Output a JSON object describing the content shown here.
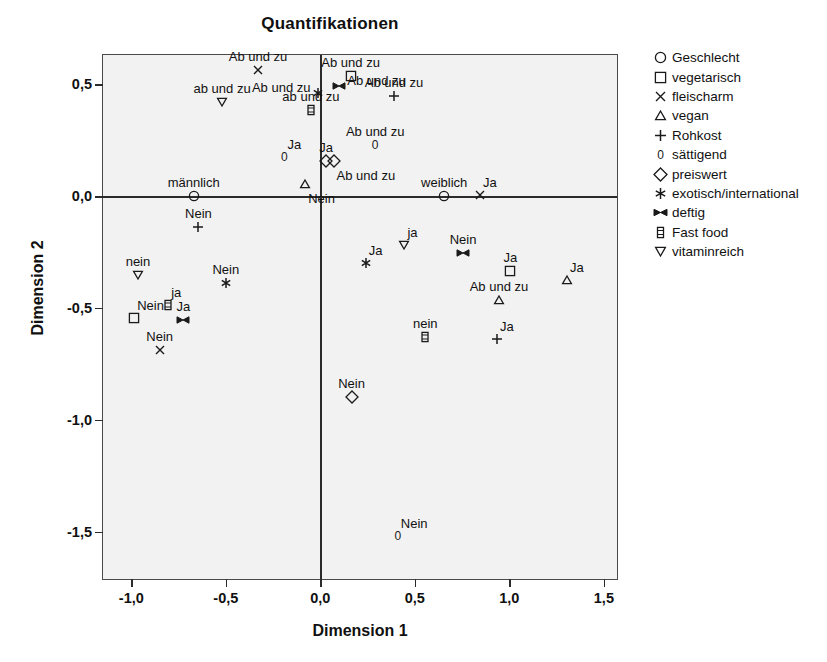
{
  "chart_data": {
    "type": "scatter",
    "title": "Quantifikationen",
    "xlabel": "Dimension 1",
    "ylabel": "Dimension 2",
    "xlim": [
      -1.15,
      1.58
    ],
    "ylim": [
      -1.72,
      0.63
    ],
    "xticks": [
      -1.0,
      -0.5,
      0.0,
      0.5,
      1.0,
      1.5
    ],
    "xticklabels": [
      "-1,0",
      "-0,5",
      "0,0",
      "0,5",
      "1,0",
      "1,5"
    ],
    "yticks": [
      0.5,
      0.0,
      -0.5,
      -1.0,
      -1.5
    ],
    "yticklabels": [
      "0,5",
      "0,0",
      "-0,5",
      "-1,0",
      "-1,5"
    ],
    "grid": false,
    "legend_position": "right",
    "legend": [
      {
        "name": "Geschlecht",
        "marker": "circle"
      },
      {
        "name": "vegetarisch",
        "marker": "square"
      },
      {
        "name": "fleischarm",
        "marker": "cross-x"
      },
      {
        "name": "vegan",
        "marker": "triangle-up"
      },
      {
        "name": "Rohkost",
        "marker": "plus"
      },
      {
        "name": "sättigend",
        "marker": "digit-zero"
      },
      {
        "name": "preiswert",
        "marker": "diamond"
      },
      {
        "name": "exotisch/international",
        "marker": "asterisk"
      },
      {
        "name": "deftig",
        "marker": "bowtie"
      },
      {
        "name": "Fast food",
        "marker": "fastfood"
      },
      {
        "name": "vitaminreich",
        "marker": "triangle-down"
      }
    ],
    "points": [
      {
        "series": "fleischarm",
        "marker": "cross-x",
        "label": "Ab und zu",
        "x": -0.33,
        "y": 0.565,
        "lpos": "above"
      },
      {
        "series": "vitaminreich",
        "marker": "triangle-down",
        "label": "ab und zu",
        "x": -0.52,
        "y": 0.42,
        "lpos": "above"
      },
      {
        "series": "exotisch/international",
        "marker": "asterisk",
        "label": "Ab und zu",
        "x": -0.01,
        "y": 0.46,
        "lpos": "left"
      },
      {
        "series": "Fast food",
        "marker": "fastfood",
        "label": "ab und zu",
        "x": -0.05,
        "y": 0.385,
        "lpos": "above"
      },
      {
        "series": "deftig",
        "marker": "bowtie",
        "label": "Ab und zu",
        "x": 0.1,
        "y": 0.49,
        "lpos": "right"
      },
      {
        "series": "vegetarisch",
        "marker": "square",
        "label": "Ab und zu",
        "x": 0.16,
        "y": 0.535,
        "lpos": "above"
      },
      {
        "series": "Rohkost",
        "marker": "plus",
        "label": "Ab und zu",
        "x": 0.39,
        "y": 0.445,
        "lpos": "above"
      },
      {
        "series": "sättigend",
        "marker": "digit-zero",
        "label": "Ab und zu",
        "x": 0.29,
        "y": 0.23,
        "lpos": "above"
      },
      {
        "series": "sättigend",
        "marker": "digit-zero",
        "label": "Ja",
        "x": -0.19,
        "y": 0.175,
        "lpos": "above-right"
      },
      {
        "series": "preiswert",
        "marker": "diamond",
        "label": "Ja",
        "x": 0.03,
        "y": 0.155,
        "lpos": "above"
      },
      {
        "series": "preiswert",
        "marker": "diamond",
        "label": "Ab und zu",
        "x": 0.07,
        "y": 0.155,
        "lpos": "below-right"
      },
      {
        "series": "vegan",
        "marker": "triangle-up",
        "label": "Nein",
        "x": -0.08,
        "y": 0.055,
        "lpos": "below-right"
      },
      {
        "series": "Geschlecht",
        "marker": "circle",
        "label": "männlich",
        "x": -0.67,
        "y": 0.0,
        "lpos": "above"
      },
      {
        "series": "Geschlecht",
        "marker": "circle",
        "label": "weiblich",
        "x": 0.655,
        "y": 0.0,
        "lpos": "above"
      },
      {
        "series": "fleischarm",
        "marker": "cross-x",
        "label": "Ja",
        "x": 0.845,
        "y": 0.005,
        "lpos": "above-right"
      },
      {
        "series": "Rohkost",
        "marker": "plus",
        "label": "Nein",
        "x": -0.645,
        "y": -0.14,
        "lpos": "above"
      },
      {
        "series": "vitaminreich",
        "marker": "triangle-down",
        "label": "nein",
        "x": -0.965,
        "y": -0.355,
        "lpos": "above"
      },
      {
        "series": "exotisch/international",
        "marker": "asterisk",
        "label": "Nein",
        "x": -0.5,
        "y": -0.39,
        "lpos": "above"
      },
      {
        "series": "vitaminreich",
        "marker": "triangle-down",
        "label": "ja",
        "x": 0.445,
        "y": -0.22,
        "lpos": "above-right"
      },
      {
        "series": "exotisch/international",
        "marker": "asterisk",
        "label": "Ja",
        "x": 0.24,
        "y": -0.3,
        "lpos": "above-right"
      },
      {
        "series": "deftig",
        "marker": "bowtie",
        "label": "Nein",
        "x": 0.755,
        "y": -0.255,
        "lpos": "above"
      },
      {
        "series": "vegetarisch",
        "marker": "square",
        "label": "Ja",
        "x": 1.005,
        "y": -0.335,
        "lpos": "above"
      },
      {
        "series": "vegan",
        "marker": "triangle-up",
        "label": "Ja",
        "x": 1.305,
        "y": -0.375,
        "lpos": "above-right"
      },
      {
        "series": "vegan",
        "marker": "triangle-up",
        "label": "Ab und zu",
        "x": 0.945,
        "y": -0.465,
        "lpos": "above"
      },
      {
        "series": "Fast food",
        "marker": "fastfood",
        "label": "ja",
        "x": -0.805,
        "y": -0.485,
        "lpos": "above-right"
      },
      {
        "series": "vegetarisch",
        "marker": "square",
        "label": "Nein",
        "x": -0.985,
        "y": -0.545,
        "lpos": "above-right"
      },
      {
        "series": "deftig",
        "marker": "bowtie",
        "label": "Ja",
        "x": -0.725,
        "y": -0.555,
        "lpos": "above"
      },
      {
        "series": "fleischarm",
        "marker": "cross-x",
        "label": "Nein",
        "x": -0.85,
        "y": -0.69,
        "lpos": "above"
      },
      {
        "series": "Fast food",
        "marker": "fastfood",
        "label": "nein",
        "x": 0.555,
        "y": -0.63,
        "lpos": "above"
      },
      {
        "series": "Rohkost",
        "marker": "plus",
        "label": "Ja",
        "x": 0.935,
        "y": -0.64,
        "lpos": "above-right"
      },
      {
        "series": "preiswert",
        "marker": "diamond",
        "label": "Nein",
        "x": 0.165,
        "y": -0.9,
        "lpos": "above"
      },
      {
        "series": "sättigend",
        "marker": "digit-zero",
        "label": "Nein",
        "x": 0.41,
        "y": -1.52,
        "lpos": "above-right"
      }
    ]
  }
}
